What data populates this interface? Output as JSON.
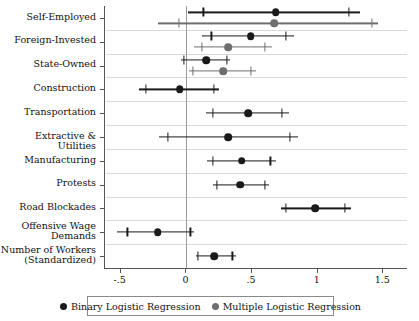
{
  "chart_data": {
    "type": "scatter",
    "title": "",
    "subtitle": "",
    "xlabel": "",
    "ylabel": "",
    "xlim": [
      -0.62,
      1.68
    ],
    "grid": true,
    "legend_position": "bottom",
    "xticks": [
      -0.5,
      0,
      0.5,
      1,
      1.5
    ],
    "xtick_labels": [
      "-.5",
      "0",
      ".5",
      "1",
      "1.5"
    ],
    "reference_line": 0,
    "categories": [
      "Self-Employed",
      "Foreign-Invested",
      "State-Owned",
      "Construction",
      "Transportation",
      "Extractive & Utilities",
      "Manufacturing",
      "Protests",
      "Road Blockades",
      "Offensive Wage\nDemands",
      "Number of Workers\n(Standardized)"
    ],
    "series": [
      {
        "name": "Binary Logistic Regression",
        "color": "#1a1a1a",
        "points": [
          {
            "category": "Self-Employed",
            "estimate": 0.68,
            "ci_low": 0.01,
            "ci_high": 1.32,
            "inner_low": 0.13,
            "inner_high": 1.24
          },
          {
            "category": "Foreign-Invested",
            "estimate": 0.49,
            "ci_low": 0.12,
            "ci_high": 0.82,
            "inner_low": 0.19,
            "inner_high": 0.76
          },
          {
            "category": "State-Owned",
            "estimate": 0.15,
            "ci_low": -0.04,
            "ci_high": 0.33,
            "inner_low": -0.02,
            "inner_high": 0.31
          },
          {
            "category": "Construction",
            "estimate": -0.05,
            "ci_low": -0.36,
            "ci_high": 0.25,
            "inner_low": -0.31,
            "inner_high": 0.21
          },
          {
            "category": "Transportation",
            "estimate": 0.47,
            "ci_low": 0.15,
            "ci_high": 0.78,
            "inner_low": 0.2,
            "inner_high": 0.73
          },
          {
            "category": "Extractive & Utilities",
            "estimate": 0.32,
            "ci_low": -0.21,
            "ci_high": 0.85,
            "inner_low": -0.14,
            "inner_high": 0.79
          },
          {
            "category": "Manufacturing",
            "estimate": 0.42,
            "ci_low": 0.16,
            "ci_high": 0.68,
            "inner_low": 0.2,
            "inner_high": 0.64
          },
          {
            "category": "Protests",
            "estimate": 0.41,
            "ci_low": 0.2,
            "ci_high": 0.63,
            "inner_low": 0.23,
            "inner_high": 0.6
          },
          {
            "category": "Road Blockades",
            "estimate": 0.98,
            "ci_low": 0.72,
            "ci_high": 1.25,
            "inner_low": 0.76,
            "inner_high": 1.21
          },
          {
            "category": "Offensive Wage\nDemands",
            "estimate": -0.22,
            "ci_low": -0.53,
            "ci_high": 0.06,
            "inner_low": -0.45,
            "inner_high": 0.03
          },
          {
            "category": "Number of Workers\n(Standardized)",
            "estimate": 0.21,
            "ci_low": 0.07,
            "ci_high": 0.38,
            "inner_low": 0.09,
            "inner_high": 0.35
          }
        ]
      },
      {
        "name": "Multiple Logistic Regression",
        "color": "#6e6e6e",
        "points": [
          {
            "category": "Self-Employed",
            "estimate": 0.67,
            "ci_low": -0.22,
            "ci_high": 1.46,
            "inner_low": -0.06,
            "inner_high": 1.41
          },
          {
            "category": "Foreign-Invested",
            "estimate": 0.32,
            "ci_low": 0.06,
            "ci_high": 0.65,
            "inner_low": 0.12,
            "inner_high": 0.6
          },
          {
            "category": "State-Owned",
            "estimate": 0.28,
            "ci_low": 0.02,
            "ci_high": 0.53,
            "inner_low": 0.05,
            "inner_high": 0.49
          }
        ]
      }
    ]
  },
  "legend": {
    "entries": [
      {
        "label": "Binary Logistic Regression",
        "color": "#1a1a1a"
      },
      {
        "label": "Multiple Logistic Regression",
        "color": "#6e6e6e"
      }
    ]
  }
}
